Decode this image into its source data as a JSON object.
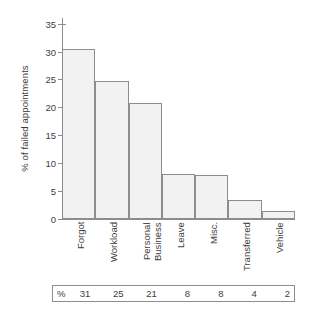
{
  "chart_data": {
    "type": "bar",
    "title": "",
    "subtitle": "",
    "xlabel": "",
    "ylabel": "% of failed appointments",
    "ylim": [
      0,
      36
    ],
    "yticks": [
      0,
      5,
      10,
      15,
      20,
      25,
      30,
      35
    ],
    "ytick_labels": [
      "0",
      "5",
      "10",
      "15",
      "20",
      "25",
      "30",
      "35"
    ],
    "grid": false,
    "legend": "none",
    "categories": [
      "Forgot",
      "Workload",
      "Personal\nBusiness",
      "Leave",
      "Misc.",
      "Transferred",
      "Vehicle"
    ],
    "category_labels_rotation_deg": -90,
    "values": [
      30.5,
      24.7,
      20.7,
      8.0,
      7.9,
      3.4,
      1.5
    ],
    "bar_fill": "#f2f2f2",
    "bar_edge": "#8d8d8d",
    "axis_color": "#8d8d8d",
    "text_color": "#3d3d3d",
    "background": "#ffffff",
    "data_table": {
      "row_marker": "%",
      "values": [
        "31",
        "25",
        "21",
        "8",
        "8",
        "4",
        "2"
      ]
    },
    "annotations": []
  }
}
